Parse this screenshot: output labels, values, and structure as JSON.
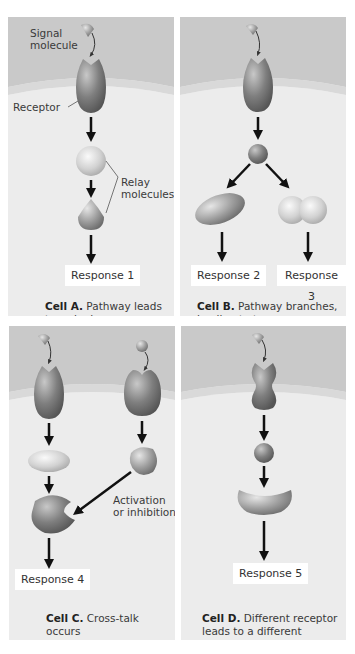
{
  "cells": {
    "a": {
      "labels": {
        "signal": "Signal\nmolecule",
        "signal_line1": "Signal",
        "signal_line2": "molecule",
        "receptor": "Receptor",
        "relay_line1": "Relay",
        "relay_line2": "molecules"
      },
      "responses": [
        "Response 1"
      ],
      "caption_bold": "Cell A.",
      "caption_line1": "Pathway leads",
      "caption_line2": "to a single response"
    },
    "b": {
      "responses": [
        "Response 2",
        "Response 3"
      ],
      "caption_bold": "Cell B.",
      "caption_line1": "Pathway branches,",
      "caption_line2": "leading to two responses"
    },
    "c": {
      "labels": {
        "crosstalk_line1": "Activation",
        "crosstalk_line2": "or inhibition"
      },
      "responses": [
        "Response 4"
      ],
      "caption_bold": "Cell C.",
      "caption_line1": "Cross-talk occurs",
      "caption_line2": "between two pathways"
    },
    "d": {
      "responses": [
        "Response 5"
      ],
      "caption_bold": "Cell D.",
      "caption_line1": "Different receptor",
      "caption_line2": "leads to a different response"
    }
  },
  "colors": {
    "extracellular": "#c9c9c9",
    "cytoplasm": "#ebebeb",
    "membrane": "#d6d6d6",
    "molecule_dark": "#7a7a7a",
    "molecule_light": "#d0d0d0",
    "arrow": "#111111",
    "response_box": "#ffffff"
  }
}
